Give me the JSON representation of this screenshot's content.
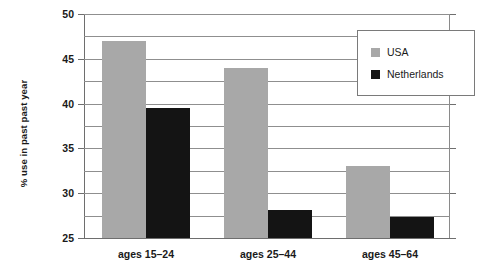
{
  "chart_data": {
    "type": "bar",
    "title": "",
    "subtitle": "",
    "xlabel": "",
    "ylabel": "% use in past past year",
    "categories": [
      "ages 15–24",
      "ages 25–44",
      "ages 45–64"
    ],
    "series": [
      {
        "name": "USA",
        "color": "#a8a8a8",
        "values": [
          44,
          38,
          16
        ]
      },
      {
        "name": "Netherlands",
        "color": "#141414",
        "values": [
          29,
          6.3,
          4.7
        ]
      }
    ],
    "ylim": [
      0,
      50
    ],
    "ytick_step": 5,
    "yticks": [
      0,
      5,
      10,
      15,
      20,
      25,
      30,
      35,
      40,
      45,
      50
    ],
    "ytick_labels": [
      "0",
      "5",
      "10",
      "15",
      "20",
      "25",
      "30",
      "35",
      "40",
      "45",
      "50"
    ],
    "grid": true,
    "grid_axis": "y",
    "legend_position": "top-right",
    "legend_entries": [
      "USA",
      "Netherlands"
    ],
    "annotations": []
  },
  "colors": {
    "usa": "#a8a8a8",
    "netherlands": "#141414",
    "grid": "#8f8f8f",
    "axis": "#6e6e6e",
    "background": "#ffffff",
    "text": "#1a1a1a"
  }
}
